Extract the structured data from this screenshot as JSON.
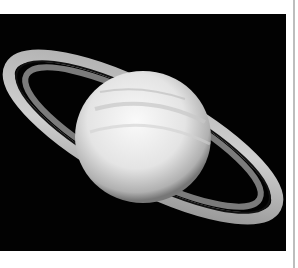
{
  "image": {
    "subject": "Saturn with rings",
    "alt": "Black-and-white photograph of the planet Saturn and its rings against a black sky",
    "colors": {
      "space": "#020202",
      "planet_light": "#f2f2f2",
      "planet_shadow": "#9a9a9a",
      "ring_light": "#d8d8d8",
      "border_line": "#bdbdbd",
      "page_background": "#ffffff"
    }
  }
}
